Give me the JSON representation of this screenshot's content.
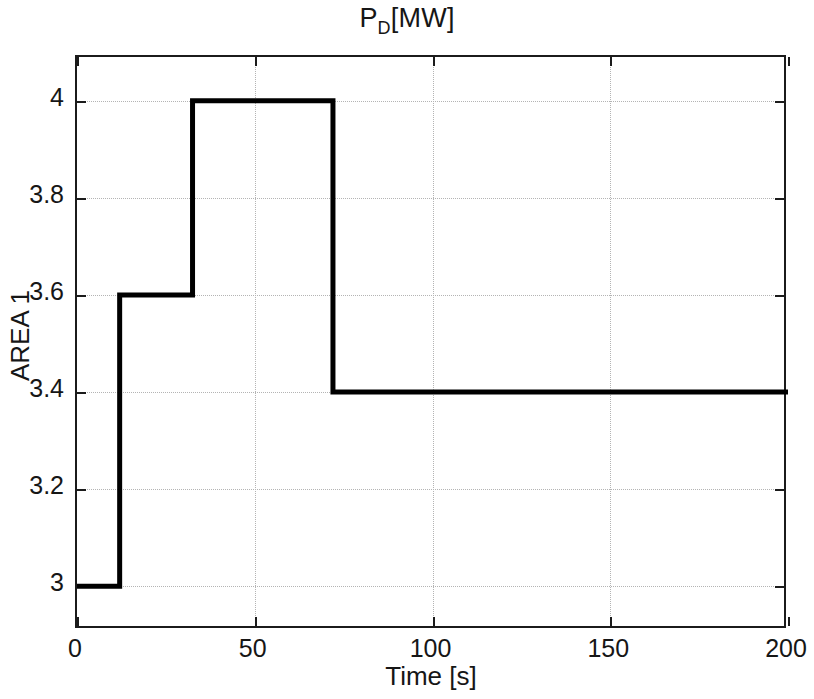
{
  "chart_data": {
    "type": "line",
    "title_parts": {
      "base": "P",
      "subscript": "D",
      "tail": "[MW]"
    },
    "xlabel": "Time [s]",
    "ylabel": "AREA 1",
    "xlim": [
      0,
      200
    ],
    "ylim": [
      2.91,
      4.09
    ],
    "xticks": [
      0,
      50,
      100,
      150,
      200
    ],
    "xticklabels": [
      "0",
      "50",
      "100",
      "150",
      "200"
    ],
    "yticks": [
      3,
      3.2,
      3.4,
      3.6,
      3.8,
      4
    ],
    "yticklabels": [
      "3",
      "3.2",
      "3.4",
      "3.6",
      "3.8",
      "4"
    ],
    "grid": true,
    "grid_style": "dotted",
    "legend": null,
    "line_color": "#000000",
    "line_width": 5,
    "step_type": "post",
    "series": [
      {
        "name": "P_D",
        "x": [
          0,
          12,
          12,
          32.5,
          32.5,
          72,
          72,
          200
        ],
        "y": [
          3,
          3,
          3.6,
          3.6,
          4,
          4,
          3.4,
          3.4
        ]
      }
    ],
    "steps": [
      {
        "t_start": 0,
        "t_end": 12,
        "value": 3
      },
      {
        "t_start": 12,
        "t_end": 32.5,
        "value": 3.6
      },
      {
        "t_start": 32.5,
        "t_end": 72,
        "value": 4
      },
      {
        "t_start": 72,
        "t_end": 200,
        "value": 3.4
      }
    ]
  }
}
